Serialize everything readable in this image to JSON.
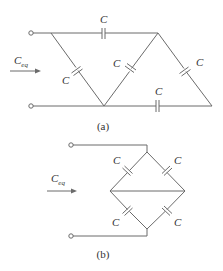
{
  "diagram_a": {
    "caption": "(a)",
    "equivalent_label": "C",
    "equivalent_sub": "eq",
    "capacitors": [
      {
        "id": "top",
        "label": "C"
      },
      {
        "id": "left-diagonal",
        "label": "C"
      },
      {
        "id": "middle-diagonal",
        "label": "C"
      },
      {
        "id": "right-diagonal",
        "label": "C"
      },
      {
        "id": "bottom",
        "label": "C"
      }
    ]
  },
  "diagram_b": {
    "caption": "(b)",
    "equivalent_label": "C",
    "equivalent_sub": "eq",
    "capacitors": [
      {
        "id": "upper-left",
        "label": "C"
      },
      {
        "id": "upper-right",
        "label": "C"
      },
      {
        "id": "lower-left",
        "label": "C"
      },
      {
        "id": "lower-right",
        "label": "C"
      }
    ]
  },
  "colors": {
    "line": "#6b6b6b",
    "text": "#333333"
  }
}
